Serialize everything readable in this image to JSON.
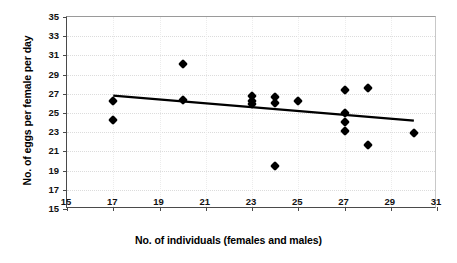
{
  "chart_data": {
    "type": "scatter",
    "title": "",
    "xlabel": "No. of individuals (females and males)",
    "ylabel": "No. of eggs per female per day",
    "xlim": [
      15,
      31
    ],
    "ylim": [
      15,
      35
    ],
    "xticks": [
      15,
      17,
      19,
      21,
      23,
      25,
      27,
      29,
      31
    ],
    "yticks": [
      15,
      17,
      19,
      21,
      23,
      25,
      27,
      29,
      31,
      33,
      35
    ],
    "xtick_step": 2,
    "ytick_step": 2,
    "grid": true,
    "legend": "none",
    "marker": "diamond",
    "marker_color": "#000000",
    "points": [
      {
        "x": 17,
        "y": 26.2
      },
      {
        "x": 17,
        "y": 24.3
      },
      {
        "x": 20,
        "y": 30.1
      },
      {
        "x": 20,
        "y": 26.4
      },
      {
        "x": 23,
        "y": 26.8
      },
      {
        "x": 23,
        "y": 26.3
      },
      {
        "x": 23,
        "y": 25.9
      },
      {
        "x": 24,
        "y": 26.7
      },
      {
        "x": 24,
        "y": 26.0
      },
      {
        "x": 24,
        "y": 19.5
      },
      {
        "x": 25,
        "y": 26.2
      },
      {
        "x": 27,
        "y": 27.4
      },
      {
        "x": 27,
        "y": 25.0
      },
      {
        "x": 27,
        "y": 24.1
      },
      {
        "x": 27,
        "y": 23.1
      },
      {
        "x": 28,
        "y": 27.6
      },
      {
        "x": 28,
        "y": 21.7
      },
      {
        "x": 30,
        "y": 22.9
      }
    ],
    "trendline": {
      "type": "linear",
      "x_start": 17,
      "y_start": 26.8,
      "x_end": 30,
      "y_end": 24.2,
      "color": "#000000",
      "width": 2.2
    }
  }
}
